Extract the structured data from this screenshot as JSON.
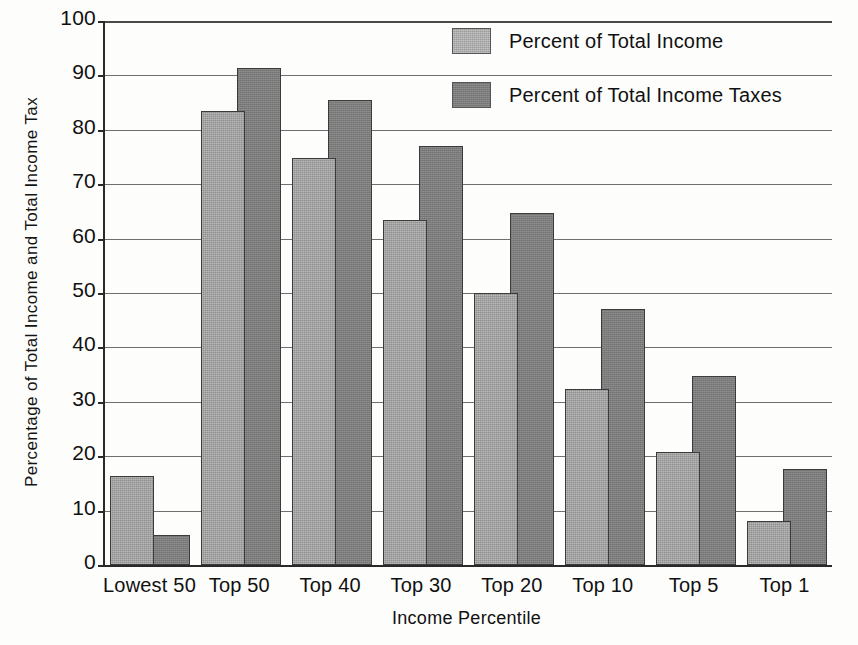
{
  "chart_data": {
    "type": "bar",
    "title": "",
    "xlabel": "Income Percentile",
    "ylabel": "Percentage of Total Income and Total Income Tax",
    "categories": [
      "Lowest 50",
      "Top 50",
      "Top 40",
      "Top 30",
      "Top 20",
      "Top 10",
      "Top 5",
      "Top 1"
    ],
    "series": [
      {
        "name": "Percent of Total Income",
        "color": "#9a9a9a",
        "values": [
          16.3,
          83.4,
          74.8,
          63.5,
          50.0,
          32.3,
          20.7,
          8.0
        ]
      },
      {
        "name": "Percent of Total Income Taxes",
        "color": "#7c7c7c",
        "values": [
          5.5,
          91.4,
          85.4,
          77.0,
          64.8,
          47.0,
          34.8,
          17.6
        ]
      }
    ],
    "ylim": [
      0,
      100
    ],
    "y_ticks": [
      0,
      10,
      20,
      30,
      40,
      50,
      60,
      70,
      80,
      90,
      100
    ],
    "y_tick_labels": [
      "0",
      "10",
      "20",
      "30",
      "40",
      "50",
      "60",
      "70",
      "80",
      "90",
      "100"
    ],
    "grid": true,
    "legend_position": "top-right"
  },
  "legend": {
    "entries": [
      {
        "label": "Percent of Total Income"
      },
      {
        "label": "Percent of Total Income Taxes"
      }
    ]
  }
}
